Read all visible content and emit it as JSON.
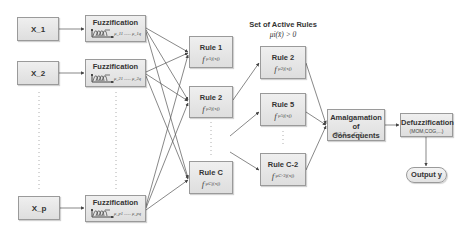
{
  "diagram": {
    "type": "fuzzy-inference-pipeline",
    "inputs": [
      {
        "label": "X_1"
      },
      {
        "label": "X_2"
      },
      {
        "label": "X_p"
      }
    ],
    "fuzzification": [
      {
        "label": "Fuzzification",
        "membership_text": "μ_11 ...... μ_1q"
      },
      {
        "label": "Fuzzification",
        "membership_text": "μ_21 ...... μ_2q"
      },
      {
        "label": "Fuzzification",
        "membership_text": "μ_p1 ...... μ_pq"
      }
    ],
    "rules": [
      {
        "label": "Rule 1",
        "formula_op": "f",
        "formula_body": "μ1j(xj)",
        "formula_index": "j=1"
      },
      {
        "label": "Rule 2",
        "formula_op": "f",
        "formula_body": "μ2j(xj)",
        "formula_index": "j=1"
      },
      {
        "label": "Rule C",
        "formula_op": "f",
        "formula_body": "μCj(xj)",
        "formula_index": "j=1"
      }
    ],
    "active_rules_header": {
      "title": "Set of Active Rules",
      "condition": "μi(x̄) > 0"
    },
    "active_rules": [
      {
        "label": "Rule 2",
        "formula_op": "f",
        "formula_body": "μ2j(xj)",
        "formula_index": "j=1"
      },
      {
        "label": "Rule 5",
        "formula_op": "f",
        "formula_body": "μ5j(xj)",
        "formula_index": "j=1"
      },
      {
        "label": "Rule C-2",
        "formula_op": "f",
        "formula_body": "μC-2j(xj)",
        "formula_index": "j=1"
      }
    ],
    "amalgamation": {
      "line1": "Amalgamation",
      "line2": "of Consequents",
      "phi": "Φ2,5,...,C-2"
    },
    "defuzzification": {
      "label": "Defuzzification",
      "methods": "(MOM,COG,...)"
    },
    "output": {
      "label": "Output y"
    },
    "colors": {
      "box_fill": "#e4e4e4",
      "box_border": "#9a9a9a",
      "arrow": "#555555",
      "text": "#333333"
    }
  }
}
